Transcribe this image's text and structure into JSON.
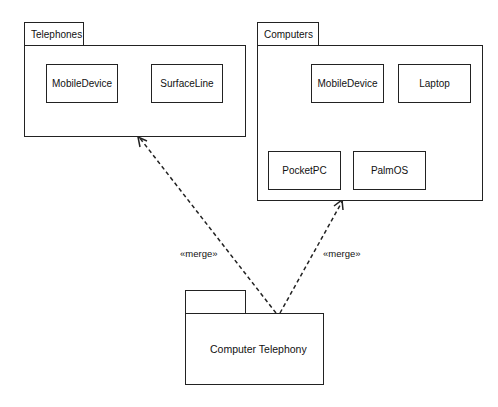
{
  "packages": {
    "telephones": {
      "name": "Telephones",
      "classes": [
        "MobileDevice",
        "SurfaceLine"
      ]
    },
    "computers": {
      "name": "Computers",
      "classes": [
        "MobileDevice",
        "Laptop",
        "PocketPC",
        "PalmOS"
      ]
    },
    "computer_telephony": {
      "name": "Computer Telephony"
    }
  },
  "relationships": {
    "left_merge": "«merge»",
    "right_merge": "«merge»"
  }
}
